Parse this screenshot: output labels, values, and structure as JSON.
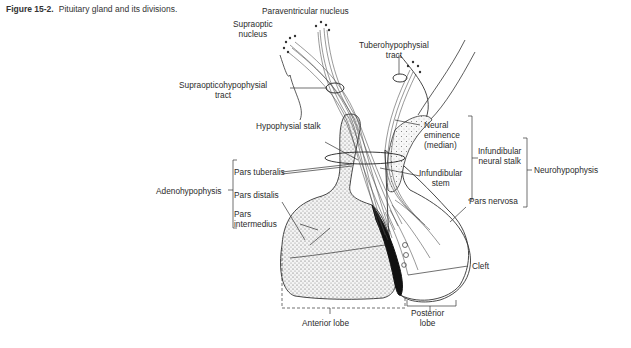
{
  "figure": {
    "number": "Figure 15-2.",
    "caption": "Pituitary gland and its divisions."
  },
  "labels": {
    "paraventricular_nucleus": "Paraventricular nucleus",
    "supraoptic_nucleus_1": "Supraoptic",
    "supraoptic_nucleus_2": "nucleus",
    "tuberohypophysial_tract_1": "Tuberohypophysial",
    "tuberohypophysial_tract_2": "tract",
    "supraopticohypophysial_tract_1": "Supraopticohypophysial",
    "supraopticohypophysial_tract_2": "tract",
    "hypophysial_stalk": "Hypophysial stalk",
    "neural_eminence_1": "Neural",
    "neural_eminence_2": "eminence",
    "neural_eminence_3": "(median)",
    "infundibular_stem_1": "Infundibular",
    "infundibular_stem_2": "stem",
    "infundibular_neural_stalk_1": "Infundibular",
    "infundibular_neural_stalk_2": "neural stalk",
    "neurohypophysis": "Neurohypophysis",
    "pars_nervosa": "Pars nervosa",
    "adenohypophysis": "Adenohypophysis",
    "pars_tuberalis": "Pars tuberalis",
    "pars_distalis": "Pars distalis",
    "pars_intermedius_1": "Pars",
    "pars_intermedius_2": "intermedius",
    "cleft": "Cleft",
    "anterior_lobe": "Anterior lobe",
    "posterior_lobe_1": "Posterior",
    "posterior_lobe_2": "lobe"
  }
}
